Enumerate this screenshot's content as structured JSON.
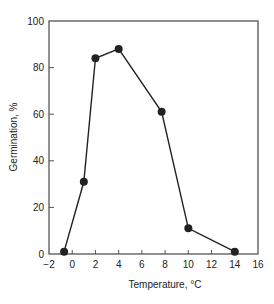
{
  "chart_data": {
    "type": "line",
    "title": "",
    "xlabel": "Temperature, °C",
    "ylabel": "Germination, %",
    "xlim": [
      -2,
      16
    ],
    "ylim": [
      0,
      100
    ],
    "xticks": [
      -2,
      0,
      2,
      4,
      6,
      8,
      10,
      12,
      14,
      16
    ],
    "yticks": [
      0,
      20,
      40,
      60,
      80,
      100
    ],
    "grid": false,
    "legend": "none",
    "series": [
      {
        "name": "Germination",
        "x": [
          -0.7,
          1,
          2,
          4,
          7.7,
          10,
          14
        ],
        "y": [
          1,
          31,
          84,
          88,
          61,
          11,
          1
        ],
        "color": "#222222",
        "marker": "filled-circle"
      }
    ]
  }
}
